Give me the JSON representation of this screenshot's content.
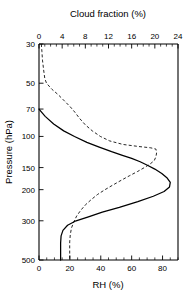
{
  "chart_data": {
    "type": "line",
    "title": "",
    "xlabel": "RH (%)",
    "xlabel_top": "Cloud fraction (%)",
    "ylabel": "Pressure (hPa)",
    "yscale": "log",
    "yinverted": true,
    "ylim": [
      30,
      500
    ],
    "xlim_bottom": [
      0,
      90
    ],
    "xlim_top": [
      0,
      24
    ],
    "grid": false,
    "legend": "none",
    "yticks": [
      30,
      50,
      70,
      100,
      150,
      200,
      300,
      500
    ],
    "ytick_labels": [
      "30",
      "50",
      "70",
      "100",
      "150",
      "200",
      "300",
      "500"
    ],
    "xticks_bottom": [
      0,
      20,
      40,
      60,
      80
    ],
    "xtick_labels_bottom": [
      "0",
      "20",
      "40",
      "60",
      "80"
    ],
    "xticks_top": [
      0,
      4,
      8,
      12,
      16,
      20,
      24
    ],
    "xtick_labels_top": [
      "0",
      "4",
      "8",
      "12",
      "16",
      "20",
      "24"
    ],
    "series": [
      {
        "name": "RH",
        "style": "solid",
        "axis": "bottom",
        "unit": "%",
        "points": [
          [
            0.0,
            70
          ],
          [
            4.0,
            77
          ],
          [
            9.5,
            85
          ],
          [
            16.0,
            93
          ],
          [
            23.0,
            100
          ],
          [
            31.0,
            108
          ],
          [
            39.0,
            115
          ],
          [
            47.0,
            122
          ],
          [
            54.0,
            128
          ],
          [
            60.0,
            133
          ],
          [
            65.5,
            139
          ],
          [
            70.5,
            146
          ],
          [
            75.0,
            153
          ],
          [
            79.5,
            162
          ],
          [
            83.0,
            172
          ],
          [
            85.0,
            182
          ],
          [
            84.5,
            193
          ],
          [
            81.0,
            205
          ],
          [
            74.0,
            218
          ],
          [
            64.0,
            234
          ],
          [
            52.0,
            252
          ],
          [
            41.0,
            268
          ],
          [
            32.0,
            285
          ],
          [
            24.0,
            300
          ],
          [
            18.5,
            318
          ],
          [
            15.5,
            340
          ],
          [
            14.3,
            365
          ],
          [
            14.0,
            400
          ],
          [
            14.0,
            440
          ],
          [
            14.0,
            500
          ]
        ]
      },
      {
        "name": "Cloud fraction",
        "style": "dashed",
        "axis": "top",
        "unit": "%",
        "points": [
          [
            0.4,
            30
          ],
          [
            0.5,
            33
          ],
          [
            0.6,
            37
          ],
          [
            0.8,
            42
          ],
          [
            1.0,
            47
          ],
          [
            1.3,
            50
          ],
          [
            2.2,
            54
          ],
          [
            3.3,
            58
          ],
          [
            4.4,
            63
          ],
          [
            5.4,
            68
          ],
          [
            6.2,
            73
          ],
          [
            7.0,
            79
          ],
          [
            8.0,
            86
          ],
          [
            9.2,
            93
          ],
          [
            10.6,
            100
          ],
          [
            12.2,
            106
          ],
          [
            14.5,
            111
          ],
          [
            17.2,
            114
          ],
          [
            19.3,
            116
          ],
          [
            20.2,
            118
          ],
          [
            20.3,
            124
          ],
          [
            20.2,
            130
          ],
          [
            19.9,
            137
          ],
          [
            19.2,
            143
          ],
          [
            18.2,
            150
          ],
          [
            17.0,
            158
          ],
          [
            15.6,
            167
          ],
          [
            14.2,
            177
          ],
          [
            12.8,
            188
          ],
          [
            11.4,
            200
          ],
          [
            10.1,
            213
          ],
          [
            9.0,
            228
          ],
          [
            8.0,
            244
          ],
          [
            7.2,
            262
          ],
          [
            6.5,
            282
          ],
          [
            6.0,
            305
          ],
          [
            5.6,
            330
          ],
          [
            5.4,
            360
          ],
          [
            5.3,
            395
          ],
          [
            5.3,
            435
          ],
          [
            5.3,
            500
          ]
        ]
      }
    ]
  },
  "labels": {
    "top_axis_title": "Cloud fraction (%)",
    "bottom_axis_title": "RH (%)",
    "left_axis_title": "Pressure (hPa)"
  },
  "colors": {
    "axis": "#000000",
    "background": "#ffffff",
    "rh_line": "#000000",
    "cloud_line": "#000000"
  }
}
